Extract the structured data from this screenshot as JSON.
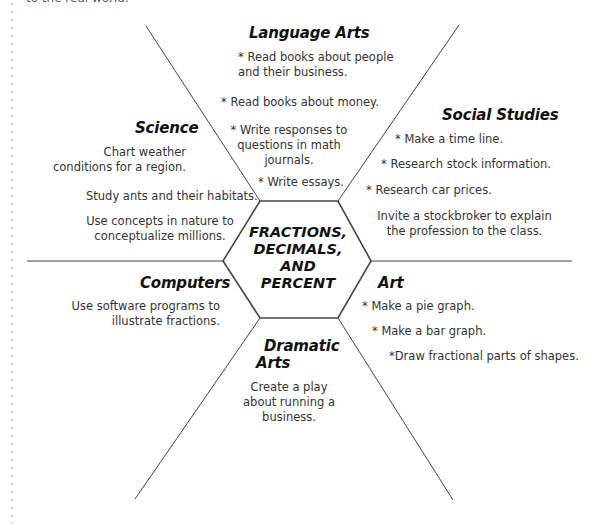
{
  "top_clipped_text": "to the real world.",
  "center": {
    "lines": [
      "FRACTIONS,",
      "DECIMALS,",
      "AND",
      "PERCENT"
    ]
  },
  "sections": {
    "language_arts": {
      "title": "Language Arts",
      "items": [
        "* Read books about people and their business.",
        "* Read books about money.",
        "* Write responses to questions in math journals.",
        "* Write essays."
      ]
    },
    "social_studies": {
      "title": "Social Studies",
      "items": [
        "* Make a time line.",
        "* Research stock information.",
        "* Research car prices.",
        "Invite a stockbroker to explain the profession to the class."
      ]
    },
    "science": {
      "title": "Science",
      "items": [
        "Chart weather conditions for a region.",
        "Study ants and their habitats.",
        "Use concepts in nature to conceptualize millions."
      ]
    },
    "computers": {
      "title": "Computers",
      "items": [
        "Use software programs to illustrate fractions."
      ]
    },
    "art": {
      "title": "Art",
      "items": [
        "* Make a pie graph.",
        "* Make a bar graph.",
        "*Draw fractional parts of shapes."
      ]
    },
    "dramatic_arts": {
      "title_lines": [
        "Dramatic",
        "Arts"
      ],
      "items": [
        "Create a play about running a business."
      ]
    }
  },
  "colors": {
    "line": "#444444",
    "text": "#333333",
    "heading": "#111111",
    "dots": "#c8c8c8"
  }
}
